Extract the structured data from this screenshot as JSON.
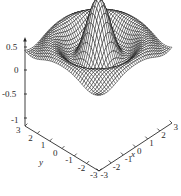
{
  "chart_data": {
    "type": "line",
    "render": "3d-wireframe-surface",
    "title": "",
    "subtitle": "",
    "xlabel": "x",
    "ylabel": "y",
    "zlabel": "",
    "function": "sin(r)/r",
    "xlim": [
      -3,
      3
    ],
    "ylim": [
      -3,
      3
    ],
    "zlim": [
      -1,
      1
    ],
    "x_ticks": [
      "-3",
      "-2",
      "-1",
      "0",
      "1",
      "2",
      "3"
    ],
    "y_ticks": [
      "3",
      "2",
      "1",
      "0",
      "-1",
      "-2",
      "-3"
    ],
    "z_ticks": [
      "0.5",
      "0",
      "-0.5",
      "-1"
    ],
    "z_tick_values": [
      0.5,
      0,
      -0.5,
      -1
    ],
    "grid": false,
    "legend": false,
    "legend_position": "none",
    "mesh_color": "#101010",
    "background_color": "#ffffff",
    "axis_color": "#2a2a2a",
    "mesh_nx": 40,
    "mesh_ny": 40,
    "peak_value": 1,
    "annotations": []
  },
  "axes": {
    "x": {
      "label": "x",
      "ticks": [
        {
          "text": "-3"
        },
        {
          "text": "-2"
        },
        {
          "text": "-1"
        },
        {
          "text": "0"
        },
        {
          "text": "1"
        },
        {
          "text": "2"
        },
        {
          "text": "3"
        }
      ]
    },
    "y": {
      "label": "y",
      "ticks": [
        {
          "text": "3"
        },
        {
          "text": "2"
        },
        {
          "text": "1"
        },
        {
          "text": "0"
        },
        {
          "text": "-1"
        },
        {
          "text": "-2"
        },
        {
          "text": "-3"
        }
      ]
    },
    "z": {
      "label": "",
      "ticks": [
        {
          "text": "0.5"
        },
        {
          "text": "0"
        },
        {
          "text": "-0.5"
        },
        {
          "text": "-1"
        }
      ]
    }
  }
}
